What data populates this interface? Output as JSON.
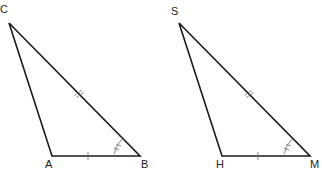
{
  "figures": [
    {
      "name": "triangle-ABC",
      "vertices": {
        "top": "C",
        "bottom_left": "A",
        "bottom_right": "B"
      },
      "marks": {
        "side_CB": "double tick",
        "side_AB": "single tick",
        "angle_B": "double arc mark"
      }
    },
    {
      "name": "triangle-HMS",
      "vertices": {
        "top": "S",
        "bottom_left": "H",
        "bottom_right": "M"
      },
      "marks": {
        "side_SM": "double tick",
        "side_HM": "single tick",
        "angle_M": "double arc mark"
      }
    }
  ],
  "colors": {
    "line": "#1a1a1a",
    "mark": "#888888"
  }
}
